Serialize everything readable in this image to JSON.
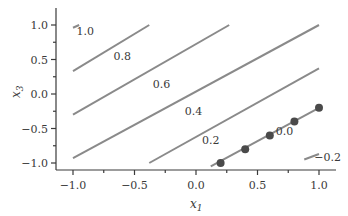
{
  "chart_data": {
    "type": "line",
    "title": "",
    "xlabel": "x1",
    "ylabel": "x3",
    "xlim": [
      -1.15,
      1.15
    ],
    "ylim": [
      -1.1,
      1.25
    ],
    "grid": false,
    "x_ticks": [
      "-1.0",
      "-0.5",
      "0.0",
      "0.5",
      "1.0"
    ],
    "y_ticks": [
      "1.0",
      "0.5",
      "0.0",
      "-0.5",
      "-1.0"
    ],
    "contour_levels": [
      "1.0",
      "0.8",
      "0.6",
      "0.4",
      "0.2",
      "0.0",
      "-0.2"
    ],
    "contours": [
      {
        "level": "1.0",
        "x": [
          -1.0,
          -0.95
        ],
        "y": [
          0.96,
          1.0
        ]
      },
      {
        "level": "0.8",
        "x": [
          -1.0,
          -0.38
        ],
        "y": [
          0.33,
          1.0
        ]
      },
      {
        "level": "0.6",
        "x": [
          -1.0,
          0.27
        ],
        "y": [
          -0.3,
          1.0
        ]
      },
      {
        "level": "0.4",
        "x": [
          -1.0,
          1.0
        ],
        "y": [
          -0.93,
          1.0
        ]
      },
      {
        "level": "0.2",
        "x": [
          -0.38,
          1.0
        ],
        "y": [
          -1.0,
          0.37
        ]
      },
      {
        "level": "0.0",
        "x": [
          0.12,
          1.0
        ],
        "y": [
          -1.05,
          -0.2
        ]
      },
      {
        "level": "-0.2",
        "x": [
          0.88,
          1.0
        ],
        "y": [
          -0.95,
          -0.87
        ]
      }
    ],
    "points": {
      "x": [
        0.2,
        0.4,
        0.6,
        0.8,
        1.0
      ],
      "y": [
        -1.0,
        -0.8,
        -0.6,
        -0.4,
        -0.2
      ]
    },
    "annotations": [
      {
        "text": "1.0",
        "x": -0.9,
        "y": 0.85
      },
      {
        "text": "0.8",
        "x": -0.6,
        "y": 0.5
      },
      {
        "text": "0.6",
        "x": -0.28,
        "y": 0.08
      },
      {
        "text": "0.4",
        "x": -0.02,
        "y": -0.3
      },
      {
        "text": "0.2",
        "x": 0.12,
        "y": -0.72
      },
      {
        "text": "0.0",
        "x": 0.72,
        "y": -0.6
      },
      {
        "text": "-0.2",
        "x": 1.07,
        "y": -0.97
      }
    ]
  },
  "axes": {
    "x_label_main": "x",
    "x_label_sub": "1",
    "y_label_main": "x",
    "y_label_sub": "3"
  }
}
